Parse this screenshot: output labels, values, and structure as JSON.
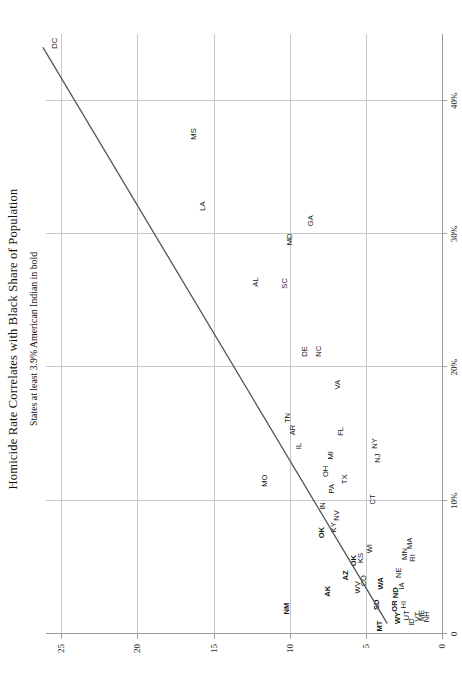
{
  "chart_data": {
    "type": "scatter",
    "title": "Homicide Rate Correlates with Black Share of Population",
    "subtitle": "States at least 3.9% American Indian in bold",
    "xlabel": "Black Share of the Population",
    "ylabel": "",
    "xlim": [
      0,
      45
    ],
    "ylim": [
      0,
      26
    ],
    "grid": true,
    "legend": "none",
    "xticks": [
      0,
      10,
      20,
      30,
      40
    ],
    "xticklabels": [
      "0",
      "10%",
      "20%",
      "30%",
      "40%"
    ],
    "yticks": [
      0,
      5,
      10,
      15,
      20,
      25
    ],
    "yticklabels": [
      "0",
      "5",
      "10",
      "15",
      "20",
      "25"
    ],
    "point_label_type": "state-abbreviation",
    "bold_meaning": "State population at least 3.9% American Indian",
    "trendline": {
      "x0": 0.8,
      "y0": 3.6,
      "x1": 44.0,
      "y1": 26.2
    },
    "points": [
      {
        "label": "NH",
        "x": 1.3,
        "y": 1.0,
        "bold": false
      },
      {
        "label": "ME",
        "x": 1.4,
        "y": 1.3,
        "bold": false
      },
      {
        "label": "VT",
        "x": 1.3,
        "y": 1.6,
        "bold": false
      },
      {
        "label": "ID",
        "x": 0.9,
        "y": 2.0,
        "bold": false
      },
      {
        "label": "UT",
        "x": 1.4,
        "y": 2.3,
        "bold": false
      },
      {
        "label": "WY",
        "x": 1.2,
        "y": 2.9,
        "bold": true
      },
      {
        "label": "HI",
        "x": 2.2,
        "y": 2.5,
        "bold": false
      },
      {
        "label": "OR",
        "x": 2.1,
        "y": 3.1,
        "bold": true
      },
      {
        "label": "MT",
        "x": 0.6,
        "y": 4.1,
        "bold": true
      },
      {
        "label": "SD",
        "x": 2.2,
        "y": 4.3,
        "bold": true
      },
      {
        "label": "ND",
        "x": 3.1,
        "y": 3.0,
        "bold": true
      },
      {
        "label": "IA",
        "x": 3.6,
        "y": 2.6,
        "bold": false
      },
      {
        "label": "WA",
        "x": 3.8,
        "y": 4.0,
        "bold": true
      },
      {
        "label": "NE",
        "x": 4.6,
        "y": 2.8,
        "bold": false
      },
      {
        "label": "MN",
        "x": 6.0,
        "y": 2.4,
        "bold": false
      },
      {
        "label": "RI",
        "x": 5.7,
        "y": 1.9,
        "bold": false
      },
      {
        "label": "MA",
        "x": 6.8,
        "y": 2.1,
        "bold": false
      },
      {
        "label": "WI",
        "x": 6.4,
        "y": 4.7,
        "bold": false
      },
      {
        "label": "CO",
        "x": 4.0,
        "y": 5.1,
        "bold": false
      },
      {
        "label": "WV",
        "x": 3.5,
        "y": 5.5,
        "bold": false
      },
      {
        "label": "KS",
        "x": 5.7,
        "y": 5.3,
        "bold": false
      },
      {
        "label": "OK",
        "x": 5.5,
        "y": 5.8,
        "bold": true
      },
      {
        "label": "AZ",
        "x": 4.4,
        "y": 6.3,
        "bold": true
      },
      {
        "label": "AK",
        "x": 3.2,
        "y": 7.5,
        "bold": true
      },
      {
        "label": "NM",
        "x": 1.9,
        "y": 10.2,
        "bold": true
      },
      {
        "label": "OK",
        "x": 7.6,
        "y": 7.9,
        "bold": true
      },
      {
        "label": "KY",
        "x": 8.0,
        "y": 7.1,
        "bold": false
      },
      {
        "label": "NV",
        "x": 8.9,
        "y": 6.9,
        "bold": false
      },
      {
        "label": "IN",
        "x": 9.6,
        "y": 7.8,
        "bold": false
      },
      {
        "label": "PA",
        "x": 10.9,
        "y": 7.2,
        "bold": false
      },
      {
        "label": "TX",
        "x": 11.6,
        "y": 6.4,
        "bold": false
      },
      {
        "label": "CT",
        "x": 10.1,
        "y": 4.5,
        "bold": false
      },
      {
        "label": "NJ",
        "x": 13.2,
        "y": 4.2,
        "bold": false
      },
      {
        "label": "NY",
        "x": 14.3,
        "y": 4.4,
        "bold": false
      },
      {
        "label": "OH",
        "x": 12.2,
        "y": 7.6,
        "bold": false
      },
      {
        "label": "MI",
        "x": 13.4,
        "y": 7.3,
        "bold": false
      },
      {
        "label": "FL",
        "x": 15.2,
        "y": 6.6,
        "bold": false
      },
      {
        "label": "IL",
        "x": 14.1,
        "y": 9.4,
        "bold": false
      },
      {
        "label": "AR",
        "x": 15.3,
        "y": 9.8,
        "bold": false
      },
      {
        "label": "TN",
        "x": 16.2,
        "y": 10.1,
        "bold": false
      },
      {
        "label": "MO",
        "x": 11.5,
        "y": 11.6,
        "bold": false
      },
      {
        "label": "VA",
        "x": 18.7,
        "y": 6.8,
        "bold": false
      },
      {
        "label": "NC",
        "x": 21.2,
        "y": 8.1,
        "bold": false
      },
      {
        "label": "DE",
        "x": 21.2,
        "y": 9.0,
        "bold": false
      },
      {
        "label": "SC",
        "x": 26.3,
        "y": 10.3,
        "bold": false
      },
      {
        "label": "AL",
        "x": 26.4,
        "y": 12.2,
        "bold": false
      },
      {
        "label": "MD",
        "x": 29.6,
        "y": 10.0,
        "bold": false
      },
      {
        "label": "GA",
        "x": 31.0,
        "y": 8.6,
        "bold": false
      },
      {
        "label": "LA",
        "x": 32.1,
        "y": 15.7,
        "bold": false
      },
      {
        "label": "MS",
        "x": 37.5,
        "y": 16.3,
        "bold": false
      },
      {
        "label": "DC",
        "x": 44.3,
        "y": 25.4,
        "bold": false
      }
    ]
  }
}
